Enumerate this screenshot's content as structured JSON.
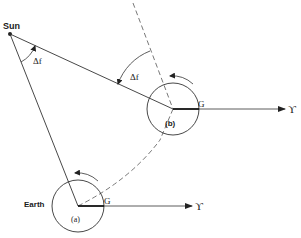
{
  "diagram": {
    "type": "orbital-geometry",
    "labels": {
      "sun": "Sun",
      "earth": "Earth",
      "position_a": "(a)",
      "position_b": "(b)",
      "greenwich_a": "G",
      "greenwich_b": "G",
      "vernal_equinox_a": "ϒ",
      "vernal_equinox_b": "ϒ",
      "angle_at_sun": "Δf",
      "angle_at_b": "Δf"
    },
    "colors": {
      "line": "#333333",
      "background": "#ffffff"
    }
  }
}
